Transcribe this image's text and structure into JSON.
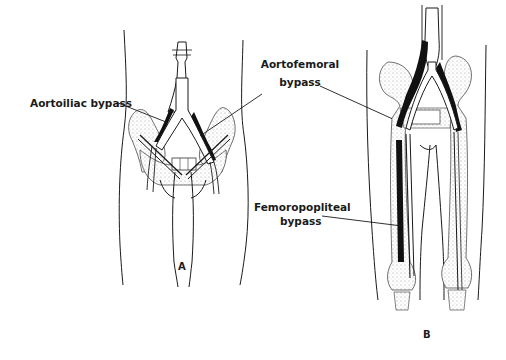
{
  "figure": {
    "panels": [
      {
        "id": "A",
        "letter": "A",
        "labels": [
          {
            "text": "Aortoiliac bypass"
          },
          {
            "line1": "Aortofemoral",
            "line2": "bypass"
          }
        ]
      },
      {
        "id": "B",
        "letter": "B",
        "labels": [
          {
            "line1": "Femoropopliteal",
            "line2": "bypass"
          }
        ]
      }
    ]
  },
  "colors": {
    "ink": "#1a1a1a",
    "background": "#ffffff",
    "stipple": "#d8d8d8"
  }
}
